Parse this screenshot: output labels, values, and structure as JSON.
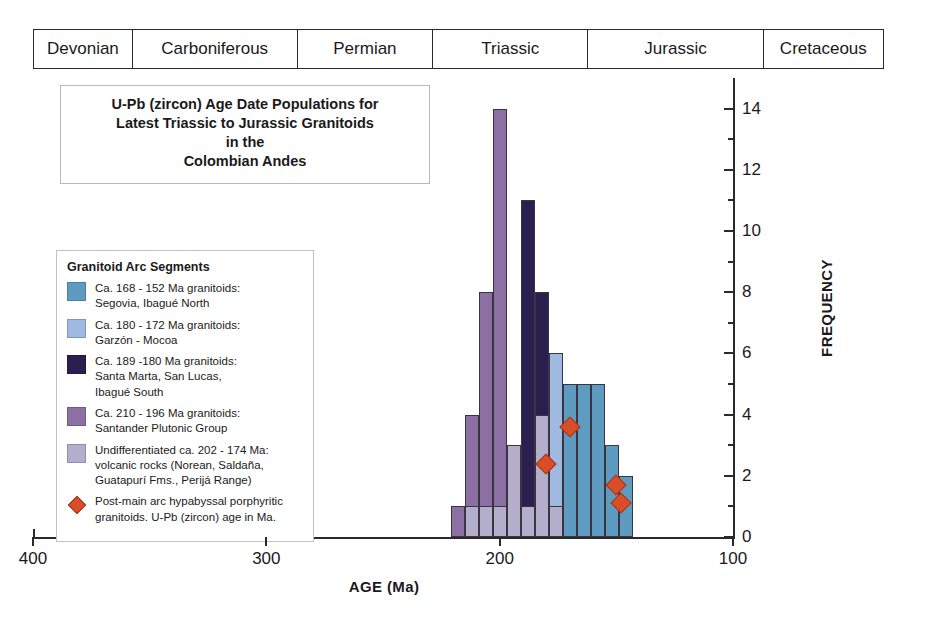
{
  "periods": [
    {
      "name": "Devonian"
    },
    {
      "name": "Carboniferous"
    },
    {
      "name": "Permian"
    },
    {
      "name": "Triassic"
    },
    {
      "name": "Jurassic"
    },
    {
      "name": "Cretaceous"
    }
  ],
  "title": {
    "line1": "U-Pb (zircon) Age Date Populations for",
    "line2": "Latest Triassic to Jurassic Granitoids",
    "line3": "in the",
    "line4": "Colombian Andes"
  },
  "legend": {
    "heading": "Granitoid Arc Segments",
    "entries": [
      {
        "color": "#5d9cc0",
        "swatch": "square",
        "line1": "Ca. 168 - 152 Ma granitoids:",
        "line2": "Segovia, Ibagué North",
        "line3": ""
      },
      {
        "color": "#9fb9e0",
        "swatch": "square",
        "line1": "Ca. 180 - 172 Ma granitoids:",
        "line2": "Garzón - Mocoa",
        "line3": ""
      },
      {
        "color": "#2a1f4e",
        "swatch": "square",
        "line1": "Ca. 189 -180 Ma granitoids:",
        "line2": "Santa Marta, San Lucas,",
        "line3": "Ibagué South"
      },
      {
        "color": "#8c6fa3",
        "swatch": "square",
        "line1": "Ca. 210 - 196 Ma granitoids:",
        "line2": "Santander Plutonic Group",
        "line3": ""
      },
      {
        "color": "#b4aecd",
        "swatch": "square",
        "line1": "Undifferentiated ca. 202 - 174 Ma:",
        "line2": "volcanic rocks (Norean, Saldaña,",
        "line3": "Guatapurí Fms., Perijá Range)"
      },
      {
        "color": "#d94e29",
        "swatch": "diamond",
        "line1": "Post-main arc hypabyssal porphyritic",
        "line2": "granitoids. U-Pb (zircon) age in Ma.",
        "line3": ""
      }
    ]
  },
  "chart_data": {
    "type": "bar",
    "title": "U-Pb (zircon) Age Date Populations for Latest Triassic to Jurassic Granitoids in the Colombian Andes",
    "xlabel": "AGE (Ma)",
    "ylabel": "FREQUENCY",
    "xlim": [
      400,
      100
    ],
    "ylim": [
      0,
      15
    ],
    "x_reversed": true,
    "x_ticks": [
      400,
      300,
      200,
      100
    ],
    "y_ticks": [
      0,
      2,
      4,
      6,
      8,
      10,
      12,
      14
    ],
    "y_minor_ticks": [
      1,
      3,
      5,
      7,
      9,
      11,
      13
    ],
    "grid": false,
    "legend_position": "left",
    "bin_width_ma": 6,
    "bars": [
      {
        "age": 218,
        "value": 1,
        "color": "#8c6fa3",
        "series": "Santander Plutonic Group"
      },
      {
        "age": 212,
        "value": 4,
        "color": "#8c6fa3",
        "series": "Santander Plutonic Group"
      },
      {
        "age": 206,
        "value": 8,
        "color": "#8c6fa3",
        "series": "Santander Plutonic Group"
      },
      {
        "age": 200,
        "value": 14,
        "color": "#8c6fa3",
        "series": "Santander Plutonic Group"
      },
      {
        "age": 194,
        "value": 3,
        "color": "#b4aecd",
        "series": "Undifferentiated volcanic rocks"
      },
      {
        "age": 188,
        "value": 11,
        "color": "#2a1f4e",
        "series": "Santa Marta, San Lucas, Ibagué South"
      },
      {
        "age": 182,
        "value": 8,
        "color": "#2a1f4e",
        "series": "Santa Marta, San Lucas, Ibagué South"
      },
      {
        "age": 176,
        "value": 6,
        "color": "#9fb9e0",
        "series": "Garzón - Mocoa"
      },
      {
        "age": 170,
        "value": 5,
        "color": "#5d9cc0",
        "series": "Segovia, Ibagué North"
      },
      {
        "age": 164,
        "value": 5,
        "color": "#5d9cc0",
        "series": "Segovia, Ibagué North"
      },
      {
        "age": 158,
        "value": 5,
        "color": "#5d9cc0",
        "series": "Segovia, Ibagué North"
      },
      {
        "age": 152,
        "value": 3,
        "color": "#5d9cc0",
        "series": "Segovia, Ibagué North"
      },
      {
        "age": 146,
        "value": 2,
        "color": "#5d9cc0",
        "series": "Segovia, Ibagué North"
      }
    ],
    "underlay_bars": [
      {
        "age": 212,
        "value": 1,
        "color": "#b4aecd",
        "series": "Undifferentiated volcanic rocks"
      },
      {
        "age": 206,
        "value": 1,
        "color": "#b4aecd",
        "series": "Undifferentiated volcanic rocks"
      },
      {
        "age": 200,
        "value": 1,
        "color": "#b4aecd",
        "series": "Undifferentiated volcanic rocks"
      },
      {
        "age": 188,
        "value": 1,
        "color": "#b4aecd",
        "series": "Undifferentiated volcanic rocks"
      },
      {
        "age": 182,
        "value": 4,
        "color": "#b4aecd",
        "series": "Undifferentiated volcanic rocks"
      },
      {
        "age": 176,
        "value": 1,
        "color": "#b4aecd",
        "series": "Undifferentiated volcanic rocks"
      }
    ],
    "diamonds": [
      {
        "age": 170,
        "value": 3.6
      },
      {
        "age": 180,
        "value": 2.4
      },
      {
        "age": 150,
        "value": 1.7
      },
      {
        "age": 148,
        "value": 1.1
      }
    ]
  }
}
